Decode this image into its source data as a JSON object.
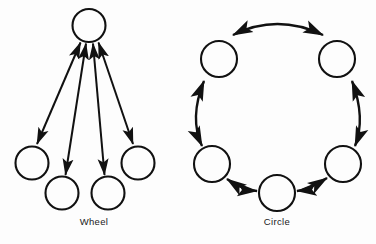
{
  "figure": {
    "background_color": "#fdfdfd",
    "stroke_color": "#111111",
    "label_color": "#1a1a1a",
    "width": 376,
    "height": 244,
    "diagrams": [
      {
        "id": "wheel",
        "label": "Wheel",
        "label_x": 94,
        "label_y": 225,
        "type": "wheel-network",
        "node_radius": 16.5,
        "nodes": [
          {
            "name": "hub",
            "cx": 89,
            "cy": 25.5,
            "r": 16.5
          },
          {
            "name": "spoke-left",
            "cx": 32,
            "cy": 163,
            "r": 16.5
          },
          {
            "name": "spoke-bottom-left",
            "cx": 62,
            "cy": 193,
            "r": 16.5
          },
          {
            "name": "spoke-bottom-right",
            "cx": 108,
            "cy": 193,
            "r": 16.5
          },
          {
            "name": "spoke-right",
            "cx": 138,
            "cy": 163,
            "r": 16.5
          }
        ],
        "links": [
          {
            "name": "hub-to-left",
            "x1": 80,
            "y1": 41,
            "x2": 37,
            "y2": 144,
            "double_headed": true
          },
          {
            "name": "hub-to-bottom-left",
            "x1": 86,
            "y1": 42.5,
            "x2": 65,
            "y2": 174,
            "double_headed": true
          },
          {
            "name": "hub-to-bottom-right",
            "x1": 93,
            "y1": 42.5,
            "x2": 105,
            "y2": 174,
            "double_headed": true
          },
          {
            "name": "hub-to-right",
            "x1": 99,
            "y1": 41,
            "x2": 133,
            "y2": 144,
            "double_headed": true
          }
        ]
      },
      {
        "id": "circle",
        "label": "Circle",
        "label_x": 277,
        "label_y": 225,
        "type": "circle-network",
        "node_radius": 18,
        "ring_center_x": 277,
        "ring_center_y": 118,
        "ring_radius": 72,
        "nodes": [
          {
            "name": "node-upper-left",
            "cx": 219,
            "cy": 59,
            "r": 18
          },
          {
            "name": "node-upper-right",
            "cx": 337,
            "cy": 59,
            "r": 18
          },
          {
            "name": "node-lower-left",
            "cx": 212,
            "cy": 164,
            "r": 18
          },
          {
            "name": "node-lower-right",
            "cx": 343,
            "cy": 164,
            "r": 18
          },
          {
            "name": "node-bottom",
            "cx": 277,
            "cy": 193,
            "r": 18
          }
        ],
        "links": [
          {
            "name": "arc-top",
            "from": "node-upper-left",
            "to": "node-upper-right",
            "double_headed": true,
            "bow": "outward-top"
          },
          {
            "name": "arc-right",
            "from": "node-upper-right",
            "to": "node-lower-right",
            "double_headed": true,
            "bow": "outward-right"
          },
          {
            "name": "arc-bottom-right",
            "from": "node-lower-right",
            "to": "node-bottom",
            "double_headed": true,
            "bow": "outward-bottom"
          },
          {
            "name": "arc-bottom-left",
            "from": "node-bottom",
            "to": "node-lower-left",
            "double_headed": true,
            "bow": "outward-bottom"
          },
          {
            "name": "arc-left",
            "from": "node-lower-left",
            "to": "node-upper-left",
            "double_headed": true,
            "bow": "outward-left"
          }
        ]
      }
    ]
  }
}
